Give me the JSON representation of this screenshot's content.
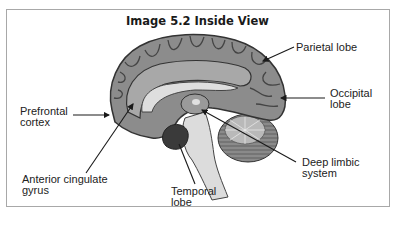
{
  "figure": {
    "title": "Image 5.2 Inside View"
  },
  "labels": [
    {
      "id": "parietal",
      "line1": "Parietal lobe",
      "line2": ""
    },
    {
      "id": "occipital",
      "line1": "Occipital",
      "line2": "lobe"
    },
    {
      "id": "prefrontal",
      "line1": "Prefrontal",
      "line2": "cortex"
    },
    {
      "id": "deep-limbic",
      "line1": "Deep limbic",
      "line2": "system"
    },
    {
      "id": "anterior-cingulate",
      "line1": "Anterior cingulate",
      "line2": "gyrus"
    },
    {
      "id": "temporal",
      "line1": "Temporal",
      "line2": "lobe"
    }
  ],
  "colors": {
    "border": "#a8a8a8",
    "cortex": "#8c8c8c",
    "cortex_dark": "#555555",
    "white_matter": "#c8c8c8",
    "brainstem": "#dcdcdc",
    "cerebellum": "#7a7a7a",
    "arrow": "#1a1a1a"
  }
}
